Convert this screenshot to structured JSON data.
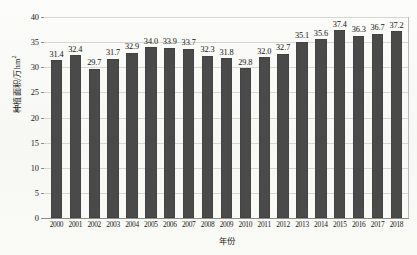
{
  "chart_data": {
    "type": "bar",
    "title": "",
    "xlabel": "年份",
    "ylabel": "种植面积/万hm²",
    "ylim": [
      0,
      40
    ],
    "ytick_values": [
      0,
      5,
      10,
      15,
      20,
      25,
      30,
      35,
      40
    ],
    "ytick_labels": [
      "0",
      "5",
      "10",
      "15",
      "20",
      "25",
      "30",
      "35",
      "40"
    ],
    "grid": true,
    "legend": null,
    "bar_color": "#4a4a4a",
    "gridline_color": "#d6d6d2",
    "axis_color": "#8d8d8a",
    "categories": [
      "2000",
      "2001",
      "2002",
      "2003",
      "2004",
      "2005",
      "2006",
      "2007",
      "2008",
      "2009",
      "2010",
      "2011",
      "2012",
      "2013",
      "2014",
      "2015",
      "2016",
      "2017",
      "2018"
    ],
    "values": [
      31.4,
      32.4,
      29.7,
      31.7,
      32.9,
      34.0,
      33.9,
      33.7,
      32.3,
      31.8,
      29.8,
      32.0,
      32.7,
      35.1,
      35.6,
      37.4,
      36.3,
      36.7,
      37.2
    ],
    "value_labels": [
      "31.4",
      "32.4",
      "29.7",
      "31.7",
      "32.9",
      "34.0",
      "33.9",
      "33.7",
      "32.3",
      "31.8",
      "29.8",
      "32.0",
      "32.7",
      "35.1",
      "35.6",
      "37.4",
      "36.3",
      "36.7",
      "37.2"
    ]
  },
  "y_axis_title_parts": {
    "main": "种植面积/万hm",
    "superscript": "2"
  }
}
